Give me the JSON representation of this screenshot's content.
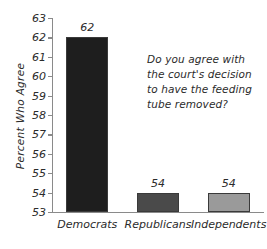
{
  "chart_data": {
    "type": "bar",
    "title": "",
    "subtitle": "",
    "xlabel": "",
    "ylabel": "Percent Who Agree",
    "categories": [
      "Democrats",
      "Republicans",
      "Independents"
    ],
    "values": [
      62,
      54,
      54
    ],
    "value_labels": [
      "62",
      "54",
      "54"
    ],
    "ylim": [
      53,
      63
    ],
    "yticks": [
      53,
      54,
      55,
      56,
      57,
      58,
      59,
      60,
      61,
      62,
      63
    ],
    "ytick_labels": [
      "53",
      "54",
      "55",
      "56",
      "57",
      "58",
      "59",
      "60",
      "61",
      "62",
      "63"
    ],
    "grid": false,
    "legend": false,
    "bar_colors": [
      "#1e1e1e",
      "#4a4a4a",
      "#9a9a9a"
    ],
    "bar_edge_color": "#3a3a3a",
    "axis_color": "#8a8a8a",
    "text_color": "#2b2b2b",
    "background": "#ffffff",
    "annotation": {
      "lines": [
        "Do you agree with",
        "the court's decision",
        "to have the feeding",
        "tube removed?"
      ]
    }
  }
}
